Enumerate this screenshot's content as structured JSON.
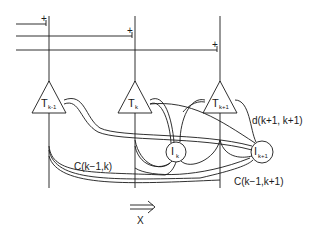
{
  "diagram": {
    "neurons": [
      {
        "id": "T_k-1",
        "symbol": "T",
        "subscript": "k-1"
      },
      {
        "id": "T_k",
        "symbol": "T",
        "subscript": "k"
      },
      {
        "id": "T_k+1",
        "symbol": "T",
        "subscript": "k+1"
      }
    ],
    "interneurons": [
      {
        "id": "I_k",
        "symbol": "I",
        "subscript": "k"
      },
      {
        "id": "I_k+1",
        "symbol": "I",
        "subscript": "k+1"
      }
    ],
    "connection_labels": {
      "d": "d(k+1, k+1)",
      "c1": "C(k−1,k)",
      "c2": "C(k−1,k+1)"
    },
    "input_markers": [
      "+",
      "+",
      "+"
    ],
    "direction_label": "X",
    "direction_arrow": "⟹"
  }
}
